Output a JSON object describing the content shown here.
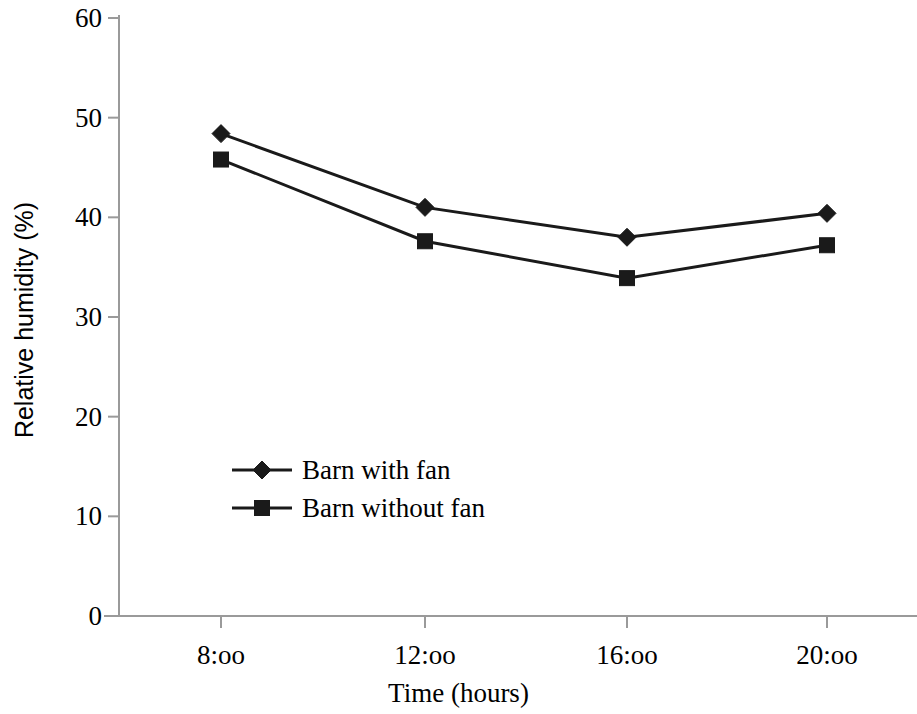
{
  "chart_data": {
    "type": "line",
    "title": "",
    "xlabel": "Time (hours)",
    "ylabel": "Relative humidity (%)",
    "categories": [
      "8:oo",
      "12:oo",
      "16:oo",
      "20:oo"
    ],
    "ylim": [
      0,
      60
    ],
    "yticks": [
      0,
      10,
      20,
      30,
      40,
      50,
      60
    ],
    "ytick_labels": [
      "0",
      "10",
      "20",
      "30",
      "40",
      "50",
      "60"
    ],
    "grid": false,
    "legend_position": "inside-lower-left",
    "series": [
      {
        "name": "Barn with fan",
        "marker": "diamond",
        "color": "#1a1a1a",
        "values": [
          48.4,
          41.0,
          38.0,
          40.4
        ]
      },
      {
        "name": "Barn without fan",
        "marker": "square",
        "color": "#1a1a1a",
        "values": [
          45.8,
          37.6,
          33.9,
          37.2
        ]
      }
    ]
  },
  "axes": {
    "line_color": "#9a9a9a",
    "tick_color": "#9a9a9a"
  },
  "legend": {
    "items": [
      {
        "label": "Barn with fan",
        "marker": "diamond-marker"
      },
      {
        "label": "Barn without fan",
        "marker": "square-marker"
      }
    ]
  }
}
